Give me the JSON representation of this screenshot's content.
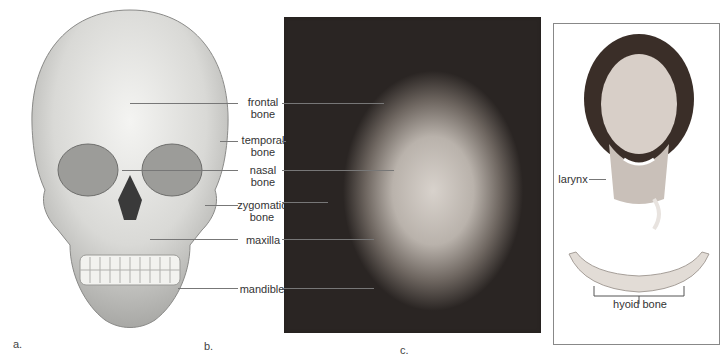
{
  "figure": {
    "panels": [
      {
        "letter": "a.",
        "type": "skull-illustration"
      },
      {
        "letter": "b.",
        "type": "face-photograph"
      },
      {
        "letter": "c.",
        "type": "neck-and-hyoid-illustration"
      }
    ],
    "labels": {
      "frontal": "frontal\nbone",
      "temporal": "temporal\nbone",
      "nasal": "nasal\nbone",
      "zygomatic": "zygomatic\nbone",
      "maxilla": "maxilla",
      "mandible": "mandible",
      "larynx": "larynx",
      "hyoid": "hyoid bone"
    },
    "panel_letters": {
      "a": "a.",
      "b": "b.",
      "c": "c."
    }
  }
}
